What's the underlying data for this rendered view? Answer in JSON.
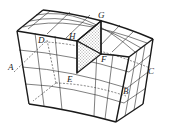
{
  "diagram": {
    "title": "",
    "type": "3D curved block with grid and section plane",
    "labels": {
      "A": "A",
      "B": "B",
      "C": "C",
      "D": "D",
      "E": "E",
      "F": "F",
      "G": "G",
      "H": "H"
    },
    "colors": {
      "line": "#1a1a1a",
      "shade_dots": "#333333",
      "background": "#ffffff"
    },
    "fill_pattern": "dotted"
  }
}
